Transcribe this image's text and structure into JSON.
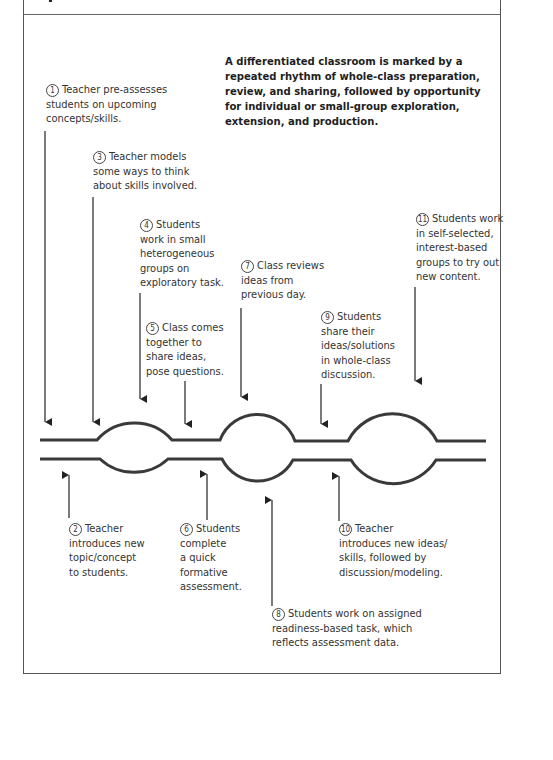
{
  "summary": "A differentiated classroom is marked by a repeated rhythm of whole-class preparation, review, and sharing, followed by opportunity for individual or small-group exploration, extension, and production.",
  "steps": [
    {
      "n": "1",
      "lines": [
        "Teacher pre-assesses",
        "students on upcoming",
        "concepts/skills."
      ]
    },
    {
      "n": "2",
      "lines": [
        "Teacher",
        "introduces new",
        "topic/concept",
        "to students."
      ]
    },
    {
      "n": "3",
      "lines": [
        "Teacher models",
        "some ways to think",
        "about skills involved."
      ]
    },
    {
      "n": "4",
      "lines": [
        "Students",
        "work in small",
        "heterogeneous",
        "groups on",
        "exploratory task."
      ]
    },
    {
      "n": "5",
      "lines": [
        "Class comes",
        "together to",
        "share ideas,",
        "pose questions."
      ]
    },
    {
      "n": "6",
      "lines": [
        "Students",
        "complete",
        "a quick",
        "formative",
        "assessment."
      ]
    },
    {
      "n": "7",
      "lines": [
        "Class reviews",
        "ideas from",
        "previous day."
      ]
    },
    {
      "n": "8",
      "lines": [
        "Students work on assigned",
        "readiness-based task, which",
        "reflects assessment data."
      ]
    },
    {
      "n": "9",
      "lines": [
        "Students",
        "share their",
        "ideas/solutions",
        "in whole-class",
        "discussion."
      ]
    },
    {
      "n": "10",
      "lines": [
        "Teacher",
        "introduces new ideas/",
        "skills, followed by",
        "discussion/modeling."
      ]
    },
    {
      "n": "11",
      "lines": [
        "Students work",
        "in self-selected,",
        "interest-based",
        "groups to try out",
        "new content."
      ]
    }
  ],
  "colors": {
    "line": "#3a3a3a",
    "text": "#333333",
    "frame": "#555555"
  }
}
